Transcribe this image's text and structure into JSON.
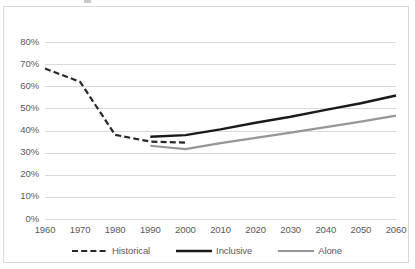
{
  "chart_data": {
    "type": "line",
    "title": "",
    "subtitle": "",
    "xlabel": "",
    "ylabel": "",
    "x": [
      1960,
      1970,
      1980,
      1990,
      2000,
      2010,
      2020,
      2030,
      2040,
      2050,
      2060
    ],
    "xlim": [
      1960,
      2060
    ],
    "ylim": [
      0,
      0.8
    ],
    "ytick_values": [
      0,
      0.1,
      0.2,
      0.3,
      0.4,
      0.5,
      0.6,
      0.7,
      0.8
    ],
    "ytick_labels": [
      "0%",
      "10%",
      "20%",
      "30%",
      "40%",
      "50%",
      "60%",
      "70%",
      "80%"
    ],
    "xtick_labels": [
      "1960",
      "1970",
      "1980",
      "1990",
      "2000",
      "2010",
      "2020",
      "2030",
      "2040",
      "2050",
      "2060"
    ],
    "grid": "horizontal",
    "legend_position": "bottom",
    "series": [
      {
        "name": "Historical",
        "style": "dashed",
        "color": "#262626",
        "width": 2.2,
        "x": [
          1960,
          1970,
          1980,
          1990,
          2000
        ],
        "values": [
          0.68,
          0.62,
          0.38,
          0.35,
          0.345
        ]
      },
      {
        "name": "Inclusive",
        "style": "solid",
        "color": "#1a1a1a",
        "width": 2.4,
        "x": [
          1990,
          2000,
          2010,
          2020,
          2030,
          2040,
          2050,
          2060
        ],
        "values": [
          0.372,
          0.379,
          0.405,
          0.435,
          0.462,
          0.493,
          0.523,
          0.558
        ]
      },
      {
        "name": "Alone",
        "style": "solid",
        "color": "#969696",
        "width": 2.2,
        "x": [
          1990,
          2000,
          2010,
          2020,
          2030,
          2040,
          2050,
          2060
        ],
        "values": [
          0.331,
          0.316,
          0.343,
          0.367,
          0.39,
          0.415,
          0.44,
          0.467
        ]
      }
    ]
  },
  "legend": {
    "items": [
      {
        "label": "Historical",
        "swatch": "dashed-black-line-icon"
      },
      {
        "label": "Inclusive",
        "swatch": "solid-black-line-icon"
      },
      {
        "label": "Alone",
        "swatch": "solid-gray-line-icon"
      }
    ]
  },
  "colors": {
    "historical": "#262626",
    "inclusive": "#1a1a1a",
    "alone": "#969696",
    "gridline": "#d9d9d9",
    "axis_text": "#595959",
    "border": "#d9d9d9",
    "background": "#ffffff"
  }
}
